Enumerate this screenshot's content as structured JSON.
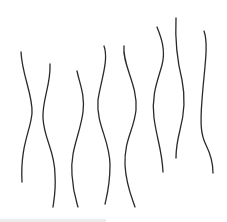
{
  "image": {
    "description": "Eight wavy vertical line strokes on white background",
    "line_count": 8,
    "stroke_color": "#2a2a2a",
    "background_color": "#ffffff"
  }
}
